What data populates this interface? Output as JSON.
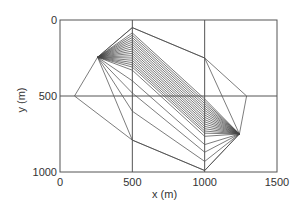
{
  "chart_data": {
    "type": "line",
    "title": "",
    "xlabel": "x (m)",
    "ylabel": "y (m)",
    "xlim": [
      0,
      1500
    ],
    "ylim": [
      1000,
      0
    ],
    "y_inverted": true,
    "grid": true,
    "x_ticks": [
      0,
      500,
      1000,
      1500
    ],
    "y_ticks": [
      0,
      500,
      1000
    ],
    "grid_lines": {
      "x": [
        500,
        1000
      ],
      "y": [
        500
      ]
    },
    "source": {
      "name": "A",
      "x": 260,
      "y": 245
    },
    "receiver": {
      "name": "B",
      "x": 1240,
      "y": 750
    },
    "bend_x": [
      500,
      1000
    ],
    "ray_bends_at_x500": [
      50,
      85,
      100,
      115,
      130,
      145,
      160,
      175,
      190,
      205,
      220,
      235,
      250,
      265,
      280,
      295,
      310,
      330,
      400,
      480,
      600,
      790
    ],
    "ray_bends_at_x1000": [
      250,
      520,
      535,
      550,
      565,
      580,
      595,
      610,
      625,
      640,
      655,
      670,
      685,
      700,
      715,
      730,
      745,
      765,
      820,
      870,
      930,
      990
    ],
    "outer_polygon": [
      [
        260,
        245
      ],
      [
        500,
        50
      ],
      [
        1000,
        250
      ],
      [
        1290,
        500
      ],
      [
        1240,
        750
      ],
      [
        1000,
        990
      ],
      [
        500,
        790
      ],
      [
        100,
        500
      ],
      [
        260,
        245
      ]
    ],
    "series": [
      {
        "name": "ray paths",
        "description": "straight segments from source A to bend at x=500, to bend at x=1000, to receiver B"
      }
    ]
  },
  "axes": {
    "x_label": "x (m)",
    "y_label": "y (m)",
    "x_tick_labels": [
      "0",
      "500",
      "1000",
      "1500"
    ],
    "y_tick_labels": [
      "0",
      "500",
      "1000"
    ]
  }
}
